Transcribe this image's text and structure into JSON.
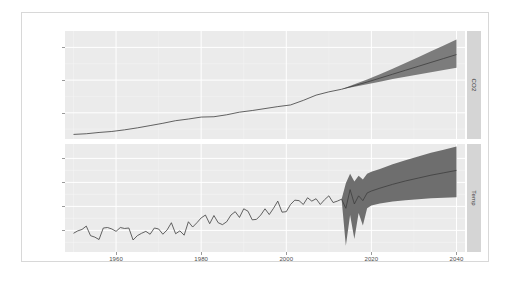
{
  "chart_data": {
    "type": "line",
    "title": "",
    "xlabel": "",
    "ylabel": "",
    "grid": true,
    "legend": "none",
    "facet_variable": "series",
    "facet_position": "right",
    "x": {
      "ticks": [
        1960,
        1980,
        2000,
        2020,
        2040
      ],
      "tick_labels": [
        "1960",
        "1980",
        "2000",
        "2020",
        "2040"
      ],
      "range": [
        1948,
        2042
      ],
      "minor_ticks": [
        1950,
        1970,
        1990,
        2010,
        2030
      ]
    },
    "panels": [
      {
        "strip_label": "CO2",
        "ylabel": "CO2",
        "y": {
          "ticks": [
            5000,
            10000,
            15000
          ],
          "tick_labels": [
            "5000",
            "10000",
            "15000"
          ],
          "range": [
            1000,
            17500
          ],
          "minor_ticks": [
            2500,
            7500,
            12500
          ]
        },
        "history": {
          "name": "CO2 observed",
          "color": "#3d3d3d",
          "x": [
            1950,
            1953,
            1956,
            1959,
            1962,
            1965,
            1968,
            1971,
            1974,
            1977,
            1980,
            1983,
            1986,
            1989,
            1992,
            1995,
            1998,
            2001,
            2004,
            2007,
            2010,
            2013
          ],
          "y": [
            1700,
            1800,
            2000,
            2150,
            2400,
            2700,
            3050,
            3400,
            3800,
            4050,
            4350,
            4400,
            4700,
            5100,
            5350,
            5650,
            5950,
            6200,
            6900,
            7700,
            8200,
            8600
          ]
        },
        "forecast": {
          "name": "CO2 forecast",
          "color": "#3d3d3d",
          "ribbon_color": "#7c7c7c",
          "x": [
            2013,
            2016,
            2019,
            2022,
            2025,
            2028,
            2031,
            2034,
            2037,
            2040
          ],
          "mean": [
            8600,
            9150,
            9700,
            10300,
            10900,
            11500,
            12100,
            12700,
            13300,
            13900
          ],
          "lower": [
            8600,
            9000,
            9350,
            9750,
            10150,
            10500,
            10850,
            11200,
            11550,
            11900
          ],
          "upper": [
            8600,
            9350,
            10100,
            10900,
            11750,
            12600,
            13500,
            14400,
            15300,
            16200
          ]
        }
      },
      {
        "strip_label": "Temp",
        "ylabel": "Temp",
        "y": {
          "ticks": [
            0.0,
            0.5,
            1.0,
            1.5
          ],
          "tick_labels": [
            "0.0",
            "0.5",
            "1.0",
            "1.5"
          ],
          "range": [
            -0.45,
            1.8
          ],
          "minor_ticks": [
            -0.25,
            0.25,
            0.75,
            1.25
          ]
        },
        "history": {
          "name": "Temp observed",
          "color": "#3d3d3d",
          "x": [
            1950,
            1951,
            1952,
            1953,
            1954,
            1955,
            1956,
            1957,
            1958,
            1959,
            1960,
            1961,
            1962,
            1963,
            1964,
            1965,
            1966,
            1967,
            1968,
            1969,
            1970,
            1971,
            1972,
            1973,
            1974,
            1975,
            1976,
            1977,
            1978,
            1979,
            1980,
            1981,
            1982,
            1983,
            1984,
            1985,
            1986,
            1987,
            1988,
            1989,
            1990,
            1991,
            1992,
            1993,
            1994,
            1995,
            1996,
            1997,
            1998,
            1999,
            2000,
            2001,
            2002,
            2003,
            2004,
            2005,
            2006,
            2007,
            2008,
            2009,
            2010,
            2011,
            2012,
            2013
          ],
          "y": [
            -0.06,
            -0.01,
            0.02,
            0.09,
            -0.11,
            -0.14,
            -0.19,
            0.05,
            0.06,
            0.03,
            -0.02,
            0.06,
            0.04,
            0.05,
            -0.2,
            -0.11,
            -0.06,
            -0.02,
            -0.08,
            0.05,
            0.03,
            -0.08,
            0.01,
            0.16,
            -0.07,
            -0.01,
            -0.1,
            0.18,
            0.07,
            0.16,
            0.26,
            0.32,
            0.14,
            0.31,
            0.16,
            0.12,
            0.18,
            0.32,
            0.39,
            0.27,
            0.45,
            0.4,
            0.22,
            0.23,
            0.32,
            0.45,
            0.33,
            0.46,
            0.61,
            0.38,
            0.39,
            0.54,
            0.63,
            0.62,
            0.54,
            0.68,
            0.61,
            0.66,
            0.54,
            0.64,
            0.72,
            0.58,
            0.61,
            0.65
          ]
        },
        "forecast": {
          "name": "Temp forecast",
          "color": "#3d3d3d",
          "ribbon_color": "#6e6e6e",
          "x": [
            2013,
            2014,
            2015,
            2016,
            2017,
            2018,
            2019,
            2020,
            2022,
            2025,
            2028,
            2031,
            2034,
            2037,
            2040
          ],
          "mean": [
            0.65,
            0.46,
            0.85,
            0.55,
            0.72,
            0.62,
            0.78,
            0.82,
            0.88,
            0.96,
            1.03,
            1.09,
            1.15,
            1.2,
            1.25
          ],
          "lower": [
            0.65,
            -0.32,
            0.32,
            -0.18,
            0.36,
            0.1,
            0.46,
            0.52,
            0.56,
            0.6,
            0.63,
            0.65,
            0.67,
            0.68,
            0.69
          ],
          "upper": [
            0.65,
            0.98,
            1.18,
            1.02,
            1.14,
            1.06,
            1.18,
            1.22,
            1.28,
            1.38,
            1.46,
            1.54,
            1.62,
            1.68,
            1.75
          ]
        }
      }
    ]
  }
}
